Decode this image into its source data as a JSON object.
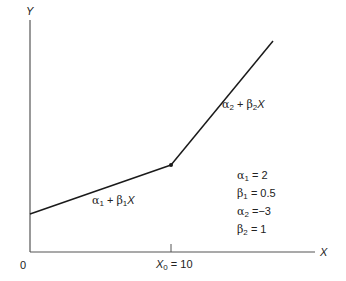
{
  "diagram": {
    "type": "piecewise-linear-function",
    "axes": {
      "y_label": "Y",
      "x_label": "X",
      "origin_label": "0"
    },
    "breakpoint": {
      "symbol": "X",
      "subscript": "0",
      "equals": "= 10",
      "value": 10
    },
    "segments": [
      {
        "alpha_sym": "α",
        "alpha_sub": "1",
        "plus": "+",
        "beta_sym": "β",
        "beta_sub": "1",
        "var": "X"
      },
      {
        "alpha_sym": "α",
        "alpha_sub": "2",
        "plus": "+",
        "beta_sym": "β",
        "beta_sub": "2",
        "var": "X"
      }
    ],
    "parameters": [
      {
        "sym": "α",
        "sub": "1",
        "eq": "= ",
        "value": "2"
      },
      {
        "sym": "β",
        "sub": "1",
        "eq": "= ",
        "value": "0.5"
      },
      {
        "sym": "α",
        "sub": "2",
        "eq": "=",
        "value": "−3"
      },
      {
        "sym": "β",
        "sub": "2",
        "eq": "= ",
        "value": "1"
      }
    ],
    "colors": {
      "line": "#1a1a1a",
      "axis": "#555555",
      "background": "#ffffff"
    }
  }
}
